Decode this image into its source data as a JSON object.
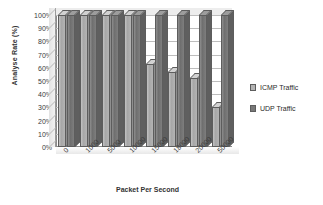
{
  "chart_data": {
    "type": "bar",
    "title": "",
    "xlabel": "Packet Per Second",
    "ylabel": "Analyse Rate (%)",
    "categories": [
      "0",
      "1000",
      "5000",
      "10000",
      "15000",
      "18000",
      "20000",
      "50000"
    ],
    "series": [
      {
        "name": "ICMP Traffic",
        "color": "#b4b4b4",
        "values": [
          100,
          100,
          100,
          100,
          63,
          57,
          52,
          30
        ]
      },
      {
        "name": "UDP Traffic",
        "color": "#787878",
        "values": [
          100,
          100,
          100,
          100,
          100,
          100,
          100,
          100
        ]
      }
    ],
    "ylim": [
      0,
      100
    ],
    "ytick_labels": [
      "100%",
      "90%",
      "80%",
      "70%",
      "60%",
      "50%",
      "40%",
      "30%",
      "20%",
      "10%",
      "0%"
    ],
    "ytick_values": [
      100,
      90,
      80,
      70,
      60,
      50,
      40,
      30,
      20,
      10,
      0
    ],
    "grid": true,
    "legend_position": "right",
    "legend_entries": [
      "ICMP Traffic",
      "UDP Traffic"
    ]
  }
}
